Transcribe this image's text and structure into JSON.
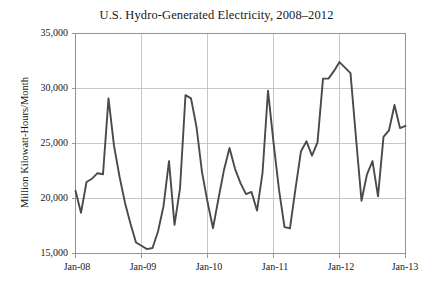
{
  "chart_data": {
    "type": "line",
    "title": "U.S. Hydro-Generated Electricity, 2008–2012",
    "xlabel": "",
    "ylabel": "Million Kilowatt-Hours/Month",
    "ylim": [
      15000,
      35000
    ],
    "yticks": [
      15000,
      20000,
      25000,
      30000,
      35000
    ],
    "ytick_labels": [
      "15,000",
      "20,000",
      "25,000",
      "30,000",
      "35,000"
    ],
    "xticks": [
      "Jan-08",
      "Jan-09",
      "Jan-10",
      "Jan-11",
      "Jan-12",
      "Jan-13"
    ],
    "xtick_labels": [
      "Jan-08",
      "Jan-09",
      "Jan-10",
      "Jan-11",
      "Jan-12",
      "Jan-13"
    ],
    "grid": true,
    "legend": false,
    "line_color": "#4a4a4a",
    "grid_color": "#b9b9b9",
    "x": [
      "Jan-08",
      "Feb-08",
      "Mar-08",
      "Apr-08",
      "May-08",
      "Jun-08",
      "Jul-08",
      "Aug-08",
      "Sep-08",
      "Oct-08",
      "Nov-08",
      "Dec-08",
      "Jan-09",
      "Feb-09",
      "Mar-09",
      "Apr-09",
      "May-09",
      "Jun-09",
      "Jul-09",
      "Aug-09",
      "Sep-09",
      "Oct-09",
      "Nov-09",
      "Dec-09",
      "Jan-10",
      "Feb-10",
      "Mar-10",
      "Apr-10",
      "May-10",
      "Jun-10",
      "Jul-10",
      "Aug-10",
      "Sep-10",
      "Oct-10",
      "Nov-10",
      "Dec-10",
      "Jan-11",
      "Feb-11",
      "Mar-11",
      "Apr-11",
      "May-11",
      "Jun-11",
      "Jul-11",
      "Aug-11",
      "Sep-11",
      "Oct-11",
      "Nov-11",
      "Dec-11",
      "Jan-12",
      "Feb-12",
      "Mar-12",
      "Apr-12",
      "May-12",
      "Jun-12",
      "Jul-12",
      "Aug-12",
      "Sep-12",
      "Oct-12",
      "Nov-12",
      "Dec-12",
      "Jan-13"
    ],
    "values": [
      20700,
      18700,
      21500,
      21800,
      22300,
      22200,
      29100,
      24800,
      22000,
      19600,
      17700,
      16000,
      15700,
      15400,
      15500,
      17000,
      19300,
      23400,
      17600,
      20900,
      29400,
      29100,
      26500,
      22400,
      19700,
      17300,
      20000,
      22600,
      24600,
      22700,
      21400,
      20400,
      20600,
      18900,
      22300,
      29800,
      25100,
      20800,
      17400,
      17300,
      20900,
      24300,
      25200,
      23900,
      25100,
      30900,
      30900,
      31600,
      32400,
      31900,
      31400,
      25500,
      19800,
      22200,
      23400,
      20200,
      25600,
      26200,
      28500,
      26400,
      26600
    ],
    "series_name": "U.S. Hydro-Generated Electricity"
  },
  "chart": {
    "title": "U.S. Hydro-Generated Electricity, 2008–2012",
    "ylabel": "Million Kilowatt-Hours/Month"
  }
}
